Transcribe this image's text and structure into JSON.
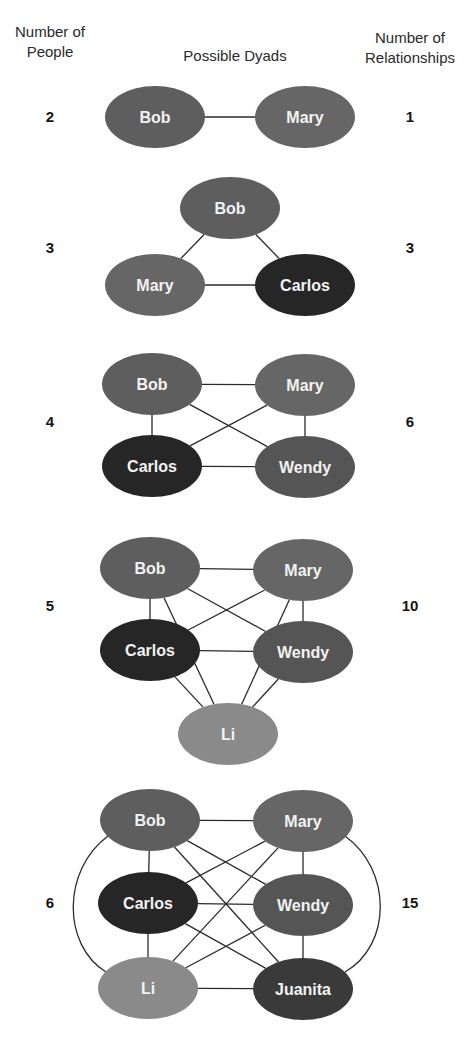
{
  "headers": {
    "left": [
      "Number of",
      "People"
    ],
    "center": "Possible Dyads",
    "right": [
      "Number of",
      "Relationships"
    ]
  },
  "colors": {
    "Bob": "#5e5e5e",
    "Mary": "#666666",
    "Carlos": "#262626",
    "Wendy": "#555555",
    "Li": "#8a8a8a",
    "Juanita": "#3a3a3a",
    "edge": "#2b2b2b",
    "label": "#f2f2f2"
  },
  "stages": [
    {
      "people": "2",
      "relationships": "1",
      "label_y": 117,
      "nodes": [
        {
          "name": "Bob",
          "cx": 155,
          "cy": 117
        },
        {
          "name": "Mary",
          "cx": 305,
          "cy": 117
        }
      ],
      "edges": [
        [
          "Bob",
          "Mary"
        ]
      ]
    },
    {
      "people": "3",
      "relationships": "3",
      "label_y": 248,
      "nodes": [
        {
          "name": "Bob",
          "cx": 230,
          "cy": 208
        },
        {
          "name": "Mary",
          "cx": 155,
          "cy": 285
        },
        {
          "name": "Carlos",
          "cx": 305,
          "cy": 285
        }
      ],
      "edges": [
        [
          "Bob",
          "Mary"
        ],
        [
          "Bob",
          "Carlos"
        ],
        [
          "Mary",
          "Carlos"
        ]
      ]
    },
    {
      "people": "4",
      "relationships": "6",
      "label_y": 422,
      "nodes": [
        {
          "name": "Bob",
          "cx": 152,
          "cy": 384
        },
        {
          "name": "Mary",
          "cx": 305,
          "cy": 385
        },
        {
          "name": "Carlos",
          "cx": 152,
          "cy": 466
        },
        {
          "name": "Wendy",
          "cx": 305,
          "cy": 467
        }
      ],
      "edges": [
        [
          "Bob",
          "Mary"
        ],
        [
          "Bob",
          "Carlos"
        ],
        [
          "Bob",
          "Wendy"
        ],
        [
          "Mary",
          "Carlos"
        ],
        [
          "Mary",
          "Wendy"
        ],
        [
          "Carlos",
          "Wendy"
        ]
      ]
    },
    {
      "people": "5",
      "relationships": "10",
      "label_y": 606,
      "nodes": [
        {
          "name": "Bob",
          "cx": 150,
          "cy": 568
        },
        {
          "name": "Mary",
          "cx": 303,
          "cy": 570
        },
        {
          "name": "Carlos",
          "cx": 150,
          "cy": 650
        },
        {
          "name": "Wendy",
          "cx": 303,
          "cy": 652
        },
        {
          "name": "Li",
          "cx": 228,
          "cy": 734
        }
      ],
      "edges": [
        [
          "Bob",
          "Mary"
        ],
        [
          "Bob",
          "Carlos"
        ],
        [
          "Bob",
          "Wendy"
        ],
        [
          "Bob",
          "Li"
        ],
        [
          "Mary",
          "Carlos"
        ],
        [
          "Mary",
          "Wendy"
        ],
        [
          "Mary",
          "Li"
        ],
        [
          "Carlos",
          "Wendy"
        ],
        [
          "Carlos",
          "Li"
        ],
        [
          "Wendy",
          "Li"
        ]
      ]
    },
    {
      "people": "6",
      "relationships": "15",
      "label_y": 903,
      "nodes": [
        {
          "name": "Bob",
          "cx": 150,
          "cy": 820
        },
        {
          "name": "Mary",
          "cx": 303,
          "cy": 821
        },
        {
          "name": "Carlos",
          "cx": 148,
          "cy": 903
        },
        {
          "name": "Wendy",
          "cx": 303,
          "cy": 905
        },
        {
          "name": "Li",
          "cx": 148,
          "cy": 988
        },
        {
          "name": "Juanita",
          "cx": 303,
          "cy": 989
        }
      ],
      "edges": [
        [
          "Bob",
          "Mary"
        ],
        [
          "Bob",
          "Carlos"
        ],
        [
          "Bob",
          "Wendy"
        ],
        [
          "Bob",
          "Juanita"
        ],
        [
          "Mary",
          "Carlos"
        ],
        [
          "Mary",
          "Wendy"
        ],
        [
          "Mary",
          "Li"
        ],
        [
          "Carlos",
          "Wendy"
        ],
        [
          "Carlos",
          "Li"
        ],
        [
          "Carlos",
          "Juanita"
        ],
        [
          "Wendy",
          "Li"
        ],
        [
          "Wendy",
          "Juanita"
        ],
        [
          "Li",
          "Juanita"
        ]
      ],
      "arcs": [
        {
          "from": "Bob",
          "to": "Li",
          "path": "M 108 836 C 62 870, 62 945, 106 972"
        },
        {
          "from": "Mary",
          "to": "Juanita",
          "path": "M 345 836 C 392 870, 392 945, 345 972"
        }
      ]
    }
  ]
}
